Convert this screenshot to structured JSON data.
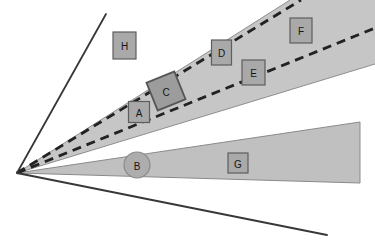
{
  "diagram": {
    "background": "#ffffff",
    "colors": {
      "upper_wedge_fill": "#c6c6c6",
      "lower_wedge_fill": "#c0c0c0",
      "wedge_edge": "#8e8e8e",
      "box_fill": "#a9a9a9",
      "box_edge": "#5e5e5e",
      "rotated_square_fill": "#9c9c9c",
      "circle_fill": "#adadad",
      "dash_line": "#222222",
      "solid_line": "#383838",
      "label_text": "#161616"
    },
    "shapes": [
      {
        "id": "A",
        "label": "A",
        "kind": "square"
      },
      {
        "id": "B",
        "label": "B",
        "kind": "circle"
      },
      {
        "id": "C",
        "label": "C",
        "kind": "rotated-square"
      },
      {
        "id": "D",
        "label": "D",
        "kind": "square"
      },
      {
        "id": "E",
        "label": "E",
        "kind": "square"
      },
      {
        "id": "F",
        "label": "F",
        "kind": "square"
      },
      {
        "id": "G",
        "label": "G",
        "kind": "square"
      },
      {
        "id": "H",
        "label": "H",
        "kind": "square"
      }
    ]
  }
}
